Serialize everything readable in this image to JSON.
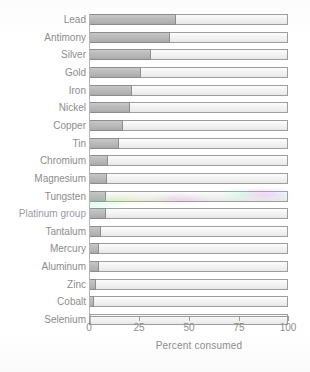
{
  "chart_data": {
    "type": "bar",
    "orientation": "horizontal",
    "stacked": true,
    "title": "",
    "xlabel": "Percent consumed",
    "ylabel": "",
    "xlim": [
      0,
      100
    ],
    "xticks": [
      0,
      25,
      50,
      75,
      100
    ],
    "xticklabels": [
      "0",
      "25",
      "50",
      "75",
      "100"
    ],
    "grid": false,
    "legend": null,
    "categories": [
      "Lead",
      "Antimony",
      "Silver",
      "Gold",
      "Iron",
      "Nickel",
      "Copper",
      "Tin",
      "Chromium",
      "Magnesium",
      "Tungsten",
      "Platinum group",
      "Tantalum",
      "Mercury",
      "Aluminum",
      "Zinc",
      "Cobalt",
      "Selenium"
    ],
    "series": [
      {
        "name": "Recycled",
        "color": "#b9b9b9",
        "values": [
          43.5,
          40.5,
          31,
          26,
          21.5,
          20.5,
          17,
          15,
          9.5,
          9,
          8.5,
          8.5,
          6,
          5,
          5,
          3.5,
          2.5,
          1
        ]
      },
      {
        "name": "Remainder",
        "color": "#f2f2f2",
        "values": [
          56.5,
          59.5,
          69,
          74,
          78.5,
          79.5,
          83,
          85,
          90.5,
          91,
          91.5,
          91.5,
          94,
          95,
          95,
          96.5,
          97.5,
          99
        ]
      }
    ],
    "values": [
      43.5,
      40.5,
      31,
      26,
      21.5,
      20.5,
      17,
      15,
      9.5,
      9,
      8.5,
      8.5,
      6,
      5,
      5,
      3.5,
      2.5,
      1
    ]
  },
  "colors": {
    "bar_fill_dark": "#b9b9b9",
    "bar_fill_light": "#f2f2f2",
    "bar_border": "#8d8d8d",
    "axis": "#9a9a9a",
    "text": "#8c8c8c",
    "background": "#ffffff"
  }
}
